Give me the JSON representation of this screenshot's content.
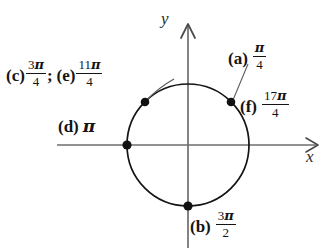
{
  "figure": {
    "type": "unit-circle-angle-diagram",
    "background_color": "#ffffff",
    "ink_color": "#141414",
    "axis_color": "#6e6e6e",
    "axes": {
      "x_label": "x",
      "y_label": "y",
      "x_arrow": "right",
      "y_arrow": "up",
      "origin": {
        "x": 188,
        "y": 145
      }
    },
    "circle": {
      "center_x": 188,
      "center_y": 145,
      "radius": 61,
      "stroke_color": "#141414"
    },
    "points": [
      {
        "id": "point-45",
        "angle_degrees": 45,
        "x": 231,
        "y": 102,
        "labels": [
          "a",
          "f"
        ]
      },
      {
        "id": "point-135",
        "angle_degrees": 135,
        "x": 145,
        "y": 102,
        "labels": [
          "c",
          "e"
        ]
      },
      {
        "id": "point-180",
        "angle_degrees": 180,
        "x": 127,
        "y": 145,
        "labels": [
          "d"
        ]
      },
      {
        "id": "point-270",
        "angle_degrees": 270,
        "x": 188,
        "y": 206,
        "labels": [
          "b"
        ]
      }
    ],
    "leaders": [
      {
        "id": "leader-a",
        "from_x": 248,
        "from_y": 64,
        "to_x": 233,
        "to_y": 100
      },
      {
        "id": "leader-e",
        "from_x": 172,
        "from_y": 80,
        "to_x": 147,
        "to_y": 101
      }
    ]
  },
  "labels": {
    "ce": {
      "tag_c": "(c)",
      "fraction_c": {
        "numerator": "3",
        "pi": "π",
        "denominator": "4"
      },
      "separator": ";",
      "tag_e": "(e)",
      "fraction_e": {
        "numerator": "11",
        "pi": "π",
        "denominator": "4"
      }
    },
    "a": {
      "tag": "(a)",
      "fraction": {
        "numerator": "",
        "pi": "π",
        "denominator": "4"
      }
    },
    "f": {
      "tag": "(f)",
      "fraction": {
        "numerator": "17",
        "pi": "π",
        "denominator": "4"
      }
    },
    "d": {
      "tag": "(d)",
      "value": "π"
    },
    "b": {
      "tag": "(b)",
      "fraction": {
        "numerator": "3",
        "pi": "π",
        "denominator": "2"
      }
    }
  }
}
